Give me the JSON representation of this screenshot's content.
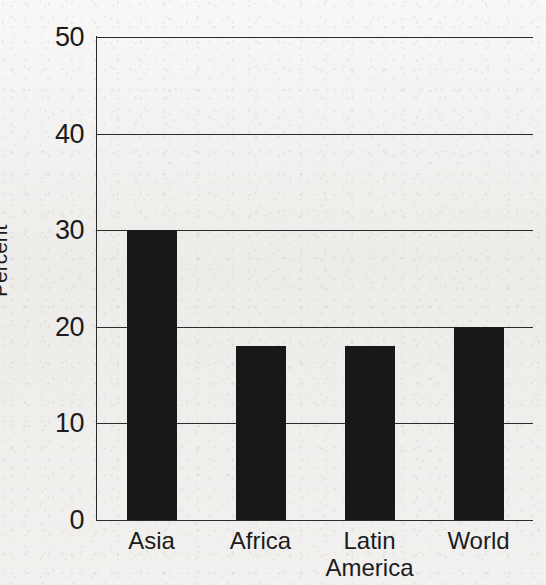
{
  "chart_data": {
    "type": "bar",
    "title": "",
    "subtitle": "",
    "xlabel": "",
    "ylabel": "Percent",
    "categories": [
      "Asia",
      "Africa",
      "Latin\nAmerica",
      "World"
    ],
    "values": [
      30,
      18,
      18,
      20
    ],
    "ylim": [
      0,
      50
    ],
    "yticks": [
      0,
      10,
      20,
      30,
      40,
      50
    ],
    "ytick_labels": [
      "0",
      "10",
      "20",
      "30",
      "40",
      "50"
    ],
    "grid": true,
    "grid_axis": "y",
    "legend": false,
    "legend_position": "none",
    "annotations": [],
    "series": [
      {
        "name": "Percent",
        "values": [
          30,
          18,
          18,
          20
        ]
      }
    ]
  },
  "style": {
    "bar_color": "#181818",
    "axis_color": "#2a2a2a",
    "text_color": "#1c1c1c",
    "background_color": "#f1f0ee"
  }
}
